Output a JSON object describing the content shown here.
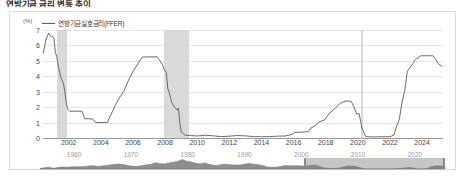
{
  "heading": "연방기금 금리 변동 추이",
  "chart_data": {
    "type": "line",
    "title": "",
    "xlabel": "",
    "ylabel": "",
    "unit_label": "(%)",
    "legend": [
      {
        "name": "연방기금실효금리(FFER)",
        "color": "#5a5a5a"
      }
    ],
    "legend_position": "top-left",
    "grid": true,
    "ylim": [
      0,
      7
    ],
    "y_ticks": [
      7,
      6,
      5,
      4,
      3,
      2,
      1,
      0
    ],
    "xlim": [
      2000.4,
      2025.3
    ],
    "x_ticks": [
      2002,
      2004,
      2006,
      2008,
      2010,
      2012,
      2014,
      2016,
      2018,
      2020,
      2022,
      2024
    ],
    "shaded_regions": [
      {
        "label": "2001 recession",
        "start": 2001.25,
        "end": 2001.92,
        "color": "#d2d2d2"
      },
      {
        "label": "2007-2009 recession",
        "start": 2007.95,
        "end": 2009.5,
        "color": "#d2d2d2"
      },
      {
        "label": "2020 recession",
        "start": 2020.17,
        "end": 2020.34,
        "color": "#d2d2d2"
      }
    ],
    "series": [
      {
        "name": "연방기금실효금리(FFER)",
        "color": "#5a5a5a",
        "x": [
          2000.42,
          2000.58,
          2000.75,
          2000.92,
          2001.0,
          2001.08,
          2001.17,
          2001.25,
          2001.33,
          2001.42,
          2001.5,
          2001.58,
          2001.67,
          2001.75,
          2001.83,
          2001.92,
          2002.08,
          2002.33,
          2002.58,
          2002.83,
          2003.0,
          2003.25,
          2003.5,
          2003.67,
          2003.92,
          2004.17,
          2004.42,
          2004.58,
          2004.75,
          2004.92,
          2005.17,
          2005.42,
          2005.67,
          2005.92,
          2006.17,
          2006.42,
          2006.58,
          2006.83,
          2007.17,
          2007.5,
          2007.67,
          2007.83,
          2007.92,
          2008.08,
          2008.17,
          2008.25,
          2008.42,
          2008.58,
          2008.75,
          2008.83,
          2008.92,
          2009.0,
          2009.25,
          2009.58,
          2010.0,
          2010.5,
          2011.0,
          2011.5,
          2012.0,
          2012.5,
          2013.0,
          2013.5,
          2014.0,
          2014.5,
          2015.0,
          2015.5,
          2015.92,
          2016.08,
          2016.5,
          2016.92,
          2017.08,
          2017.33,
          2017.58,
          2017.92,
          2018.08,
          2018.33,
          2018.58,
          2018.92,
          2019.25,
          2019.58,
          2019.75,
          2019.92,
          2020.08,
          2020.17,
          2020.25,
          2020.5,
          2021.0,
          2021.5,
          2022.0,
          2022.25,
          2022.42,
          2022.58,
          2022.75,
          2022.92,
          2023.08,
          2023.25,
          2023.42,
          2023.58,
          2023.92,
          2024.33,
          2024.67,
          2024.83,
          2025.0,
          2025.25
        ],
        "y": [
          5.5,
          6.35,
          6.8,
          6.55,
          6.6,
          6.5,
          5.55,
          5.3,
          4.8,
          4.35,
          3.95,
          3.75,
          3.55,
          3.05,
          2.45,
          1.9,
          1.72,
          1.74,
          1.74,
          1.73,
          1.24,
          1.25,
          1.22,
          1.01,
          1.0,
          1.0,
          1.02,
          1.43,
          1.76,
          2.16,
          2.63,
          3.0,
          3.62,
          4.16,
          4.59,
          4.99,
          5.25,
          5.25,
          5.26,
          5.26,
          5.02,
          4.76,
          4.49,
          4.24,
          3.18,
          2.98,
          2.28,
          2.01,
          1.81,
          1.94,
          1.0,
          0.39,
          0.18,
          0.16,
          0.13,
          0.18,
          0.14,
          0.09,
          0.12,
          0.16,
          0.14,
          0.09,
          0.08,
          0.09,
          0.12,
          0.13,
          0.24,
          0.36,
          0.38,
          0.41,
          0.65,
          0.79,
          1.04,
          1.16,
          1.41,
          1.7,
          1.91,
          2.27,
          2.4,
          2.38,
          2.04,
          1.55,
          1.58,
          1.1,
          0.65,
          0.08,
          0.07,
          0.08,
          0.08,
          0.2,
          0.77,
          1.21,
          2.33,
          3.08,
          4.33,
          4.57,
          4.83,
          5.08,
          5.33,
          5.33,
          5.33,
          5.13,
          4.83,
          4.62
        ]
      }
    ]
  },
  "navigator": {
    "labels": [
      {
        "text": "1960",
        "position": 1960
      },
      {
        "text": "1970",
        "position": 1970
      },
      {
        "text": "1980",
        "position": 1980
      },
      {
        "text": "1990",
        "position": 1990
      },
      {
        "text": "2000",
        "position": 2000
      },
      {
        "text": "2010",
        "position": 2010
      },
      {
        "text": "2020",
        "position": 2020
      }
    ],
    "range": [
      1954,
      2025.3
    ],
    "selection": [
      2000.4,
      2025.3
    ],
    "overview_y": [
      1.0,
      2.0,
      2.8,
      1.2,
      2.4,
      3.4,
      3.0,
      3.5,
      4.0,
      3.9,
      4.2,
      5.1,
      5.6,
      4.3,
      5.0,
      6.0,
      7.0,
      7.9,
      8.5,
      7.2,
      5.5,
      4.5,
      4.5,
      5.7,
      7.0,
      8.0,
      10.5,
      9.0,
      8.5,
      10.0,
      11.5,
      13.0,
      16.0,
      13.0,
      12.0,
      9.5,
      8.5,
      10.2,
      8.0,
      6.3,
      6.0,
      8.0,
      7.5,
      7.0,
      6.7,
      6.8,
      8.2,
      9.2,
      8.1,
      7.0,
      5.7,
      3.5,
      3.0,
      3.0,
      4.2,
      5.8,
      5.3,
      5.3,
      5.5,
      5.0,
      4.8,
      6.2,
      6.5,
      3.7,
      1.7,
      1.1,
      1.0,
      1.4,
      3.2,
      4.9,
      5.0,
      4.3,
      1.9,
      0.2,
      0.2,
      0.2,
      0.2,
      0.2,
      0.2,
      0.2,
      0.4,
      1.0,
      1.8,
      2.4,
      1.6,
      0.1,
      0.1,
      0.9,
      4.3,
      5.3,
      5.2,
      4.6
    ]
  }
}
